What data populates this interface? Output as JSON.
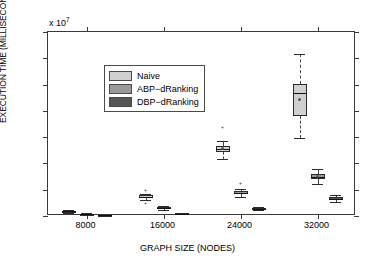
{
  "chart_data": {
    "type": "box",
    "title": "",
    "xlabel": "GRAPH SIZE (NODES)",
    "ylabel": "EXECUTION TIME (MILLISECONDS)",
    "y_multiplier": "x 10",
    "y_multiplier_exp": "7",
    "ylim": [
      0,
      14
    ],
    "yticks": [
      0,
      2,
      4,
      6,
      8,
      10,
      12,
      14
    ],
    "ytick_labels": [
      "0",
      "2",
      "4",
      "6",
      "8",
      "10",
      "12",
      "14"
    ],
    "categories": [
      "8000",
      "16000",
      "24000",
      "32000"
    ],
    "grid": false,
    "legend_position": "top-left",
    "legend": [
      "Naive",
      "ABP−dRanking",
      "DBP−dRanking"
    ],
    "colors": {
      "naive": "#d0d0d0",
      "abp": "#9a9a9a",
      "dbp": "#555555",
      "axis": "#3a3a3a",
      "median": "#111111"
    },
    "series": [
      {
        "name": "Naive",
        "color_key": "naive",
        "boxes": [
          {
            "category": "8000",
            "whisker_low": 0.26,
            "q1": 0.31,
            "median": 0.35,
            "q3": 0.39,
            "whisker_high": 0.45,
            "mean": 0.35,
            "outliers": []
          },
          {
            "category": "16000",
            "whisker_low": 1.18,
            "q1": 1.36,
            "median": 1.45,
            "q3": 1.56,
            "whisker_high": 1.7,
            "mean": 1.46,
            "outliers": [
              1.92,
              0.95
            ]
          },
          {
            "category": "24000",
            "whisker_low": 4.3,
            "q1": 4.85,
            "median": 5.1,
            "q3": 5.35,
            "whisker_high": 5.7,
            "mean": 5.1,
            "outliers": [
              6.7
            ]
          },
          {
            "category": "32000",
            "whisker_low": 5.95,
            "q1": 7.6,
            "median": 9.35,
            "q3": 10.05,
            "whisker_high": 12.35,
            "mean": 8.9,
            "outliers": []
          }
        ]
      },
      {
        "name": "ABP−dRanking",
        "color_key": "abp",
        "boxes": [
          {
            "category": "8000",
            "whisker_low": 0.06,
            "q1": 0.1,
            "median": 0.12,
            "q3": 0.15,
            "whisker_high": 0.2,
            "mean": 0.12,
            "outliers": []
          },
          {
            "category": "16000",
            "whisker_low": 0.48,
            "q1": 0.57,
            "median": 0.62,
            "q3": 0.68,
            "whisker_high": 0.78,
            "mean": 0.63,
            "outliers": []
          },
          {
            "category": "24000",
            "whisker_low": 1.45,
            "q1": 1.64,
            "median": 1.75,
            "q3": 1.88,
            "whisker_high": 2.05,
            "mean": 1.76,
            "outliers": [
              2.45
            ]
          },
          {
            "category": "32000",
            "whisker_low": 2.45,
            "q1": 2.78,
            "median": 2.98,
            "q3": 3.2,
            "whisker_high": 3.55,
            "mean": 3.0,
            "outliers": []
          }
        ]
      },
      {
        "name": "DBP−dRanking",
        "color_key": "dbp",
        "boxes": [
          {
            "category": "8000",
            "whisker_low": 0.02,
            "q1": 0.03,
            "median": 0.04,
            "q3": 0.05,
            "whisker_high": 0.07,
            "mean": 0.04,
            "outliers": []
          },
          {
            "category": "16000",
            "whisker_low": 0.12,
            "q1": 0.16,
            "median": 0.18,
            "q3": 0.21,
            "whisker_high": 0.25,
            "mean": 0.18,
            "outliers": []
          },
          {
            "category": "24000",
            "whisker_low": 0.42,
            "q1": 0.5,
            "median": 0.55,
            "q3": 0.61,
            "whisker_high": 0.7,
            "mean": 0.56,
            "outliers": []
          },
          {
            "category": "32000",
            "whisker_low": 1.05,
            "q1": 1.2,
            "median": 1.3,
            "q3": 1.42,
            "whisker_high": 1.6,
            "mean": 1.31,
            "outliers": []
          }
        ]
      }
    ]
  }
}
